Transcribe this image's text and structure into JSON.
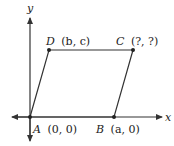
{
  "diagram": {
    "type": "parallelogram-on-coordinate-plane",
    "axes": {
      "x_label": "x",
      "y_label": "y"
    },
    "points": [
      {
        "id": "A",
        "name": "A",
        "coords": "(0, 0)",
        "px": [
          30,
          117
        ]
      },
      {
        "id": "B",
        "name": "B",
        "coords": "(a, 0)",
        "px": [
          114,
          117
        ]
      },
      {
        "id": "C",
        "name": "C",
        "coords": "(?, ?)",
        "px": [
          133,
          50
        ]
      },
      {
        "id": "D",
        "name": "D",
        "coords": "(b, c)",
        "px": [
          49,
          50
        ]
      }
    ],
    "colors": {
      "line": "#333333",
      "text": "#222222",
      "background": "#ffffff"
    }
  }
}
